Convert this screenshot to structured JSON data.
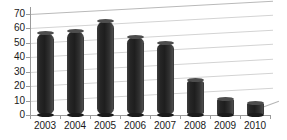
{
  "chart_data": {
    "type": "bar",
    "title": "",
    "subtitle": "",
    "xlabel": "",
    "ylabel": "",
    "categories": [
      "2003",
      "2004",
      "2005",
      "2006",
      "2007",
      "2008",
      "2009",
      "2010"
    ],
    "values": [
      57,
      58,
      65,
      54,
      50,
      24,
      11,
      8
    ],
    "ylim": [
      0,
      70
    ],
    "yticks": [
      0,
      10,
      20,
      30,
      40,
      50,
      60,
      70
    ],
    "ytick_labels": [
      "0",
      "10",
      "20",
      "30",
      "40",
      "50",
      "60",
      "70"
    ],
    "grid": true,
    "legend": false,
    "legend_position": "none",
    "series": [
      {
        "name": "",
        "values": [
          57,
          58,
          65,
          54,
          50,
          24,
          11,
          8
        ]
      }
    ],
    "style": {
      "bar_color": "#2b2b2b",
      "grid_color": "#d3d3d3",
      "axis_color": "#9a9a9a",
      "background": "#ffffff",
      "text_color": "#1a1a1a",
      "bar_shape": "cylinder",
      "perspective": "3d"
    }
  }
}
